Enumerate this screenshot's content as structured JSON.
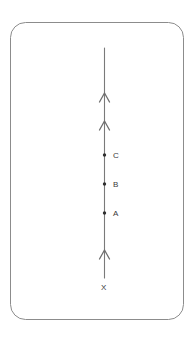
{
  "figure": {
    "card": {
      "border_color": "#8c8c8c",
      "fill_color": "#ffffff",
      "x": 10,
      "y": 22,
      "width": 174,
      "height": 298,
      "corner_radius": 15
    },
    "line": {
      "name": "vertical-ray",
      "color": "#7a7a7a",
      "x": 104.5,
      "y_top": 48,
      "y_bottom": 278,
      "stroke_width": 1.1
    },
    "arrowheads": [
      {
        "label": "direction-arrow-upper",
        "y": 95
      },
      {
        "label": "direction-arrow-middle",
        "y": 123
      },
      {
        "label": "direction-arrow-lower",
        "y": 252
      }
    ],
    "points": [
      {
        "id": "C",
        "label": "C",
        "y": 155,
        "label_x": 113,
        "dot_radius": 1.6
      },
      {
        "id": "B",
        "label": "B",
        "y": 184,
        "label_x": 113,
        "dot_radius": 1.6
      },
      {
        "id": "A",
        "label": "A",
        "y": 213,
        "label_x": 113,
        "dot_radius": 1.6
      }
    ],
    "origin": {
      "id": "X",
      "label": "X",
      "x": 104.5,
      "label_x": 101,
      "label_y": 288
    },
    "colors": {
      "stroke": "#7a7a7a",
      "border": "#8c8c8c",
      "text": "#3a3a3a",
      "background": "#ffffff"
    }
  }
}
